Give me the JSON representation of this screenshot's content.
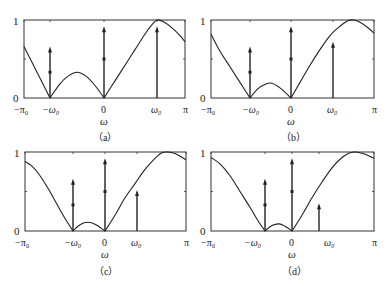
{
  "chart_data": [
    {
      "type": "line",
      "panel": "a",
      "caption": "（a）",
      "xlabel": "ω",
      "ylabel": "",
      "ylim": [
        0,
        1
      ],
      "xlim": [
        "-π",
        "π"
      ],
      "x_tick_labels": [
        "−π₀",
        "−ω₀",
        "0",
        "ω₀",
        "π"
      ],
      "y_tick_labels": [
        "0",
        "1"
      ],
      "frame": {
        "x0": 24,
        "x1": 185,
        "y0": 20,
        "y1": 98
      },
      "tick_px": {
        "-pi": 24,
        "-w0": 50,
        "0": 104,
        "w0": 157,
        "pi": 185
      },
      "curve": [
        [
          24,
          0.66
        ],
        [
          50,
          0.0
        ],
        [
          60,
          0.18
        ],
        [
          68,
          0.28
        ],
        [
          77,
          0.33
        ],
        [
          86,
          0.28
        ],
        [
          95,
          0.16
        ],
        [
          104,
          0.0
        ],
        [
          115,
          0.22
        ],
        [
          125,
          0.42
        ],
        [
          135,
          0.62
        ],
        [
          145,
          0.82
        ],
        [
          152,
          0.94
        ],
        [
          157,
          1.0
        ],
        [
          163,
          0.98
        ],
        [
          172,
          0.9
        ],
        [
          180,
          0.8
        ],
        [
          185,
          0.72
        ]
      ],
      "impulses": [
        {
          "x": "-w0",
          "px": 50,
          "height": 0.66,
          "mark": 0.33
        },
        {
          "x": "0",
          "px": 104,
          "height": 0.92,
          "mark": 0.5
        },
        {
          "x": "w0",
          "px": 157,
          "height": 0.92,
          "mark": null
        }
      ]
    },
    {
      "type": "line",
      "panel": "b",
      "caption": "（b）",
      "xlabel": "ω",
      "ylabel": "",
      "ylim": [
        0,
        1
      ],
      "xlim": [
        "-π",
        "π"
      ],
      "x_tick_labels": [
        "−π₀",
        "−ω₀",
        "0",
        "ω₀",
        "π"
      ],
      "y_tick_labels": [
        "0",
        "1"
      ],
      "frame": {
        "x0": 211,
        "x1": 374,
        "y0": 20,
        "y1": 98
      },
      "tick_px": {
        "-pi": 211,
        "-w0": 250,
        "0": 291,
        "w0": 333,
        "pi": 374
      },
      "curve": [
        [
          211,
          0.82
        ],
        [
          220,
          0.6
        ],
        [
          230,
          0.4
        ],
        [
          240,
          0.2
        ],
        [
          250,
          0.0
        ],
        [
          258,
          0.12
        ],
        [
          266,
          0.18
        ],
        [
          272,
          0.19
        ],
        [
          280,
          0.13
        ],
        [
          291,
          0.0
        ],
        [
          300,
          0.2
        ],
        [
          310,
          0.42
        ],
        [
          320,
          0.62
        ],
        [
          330,
          0.8
        ],
        [
          340,
          0.92
        ],
        [
          348,
          0.99
        ],
        [
          354,
          1.0
        ],
        [
          360,
          0.97
        ],
        [
          368,
          0.9
        ],
        [
          374,
          0.83
        ]
      ],
      "impulses": [
        {
          "x": "-w0",
          "px": 250,
          "height": 0.66,
          "mark": 0.33
        },
        {
          "x": "0",
          "px": 291,
          "height": 0.92,
          "mark": 0.5
        },
        {
          "x": "w0",
          "px": 333,
          "height": 0.72,
          "mark": null
        }
      ]
    },
    {
      "type": "line",
      "panel": "c",
      "caption": "（c）",
      "xlabel": "ω",
      "ylabel": "",
      "ylim": [
        0,
        1
      ],
      "xlim": [
        "-π",
        "π"
      ],
      "x_tick_labels": [
        "−π₀",
        "−ω₀",
        "0",
        "ω₀",
        "π"
      ],
      "y_tick_labels": [
        "0",
        "1"
      ],
      "frame": {
        "x0": 25,
        "x1": 186,
        "y0": 152,
        "y1": 231
      },
      "tick_px": {
        "-pi": 25,
        "-w0": 73,
        "0": 105,
        "w0": 137,
        "pi": 186
      },
      "curve": [
        [
          25,
          0.88
        ],
        [
          32,
          0.82
        ],
        [
          40,
          0.7
        ],
        [
          48,
          0.54
        ],
        [
          56,
          0.36
        ],
        [
          64,
          0.18
        ],
        [
          73,
          0.0
        ],
        [
          80,
          0.08
        ],
        [
          88,
          0.11
        ],
        [
          96,
          0.08
        ],
        [
          105,
          0.0
        ],
        [
          115,
          0.2
        ],
        [
          125,
          0.42
        ],
        [
          135,
          0.6
        ],
        [
          145,
          0.78
        ],
        [
          155,
          0.92
        ],
        [
          162,
          0.99
        ],
        [
          168,
          1.0
        ],
        [
          175,
          0.98
        ],
        [
          181,
          0.94
        ],
        [
          186,
          0.9
        ]
      ],
      "impulses": [
        {
          "x": "-w0",
          "px": 73,
          "height": 0.66,
          "mark": 0.33
        },
        {
          "x": "0",
          "px": 105,
          "height": 0.92,
          "mark": 0.5
        },
        {
          "x": "w0",
          "px": 137,
          "height": 0.52,
          "mark": null
        }
      ]
    },
    {
      "type": "line",
      "panel": "d",
      "caption": "（d）",
      "xlabel": "ω",
      "ylabel": "",
      "ylim": [
        0,
        1
      ],
      "xlim": [
        "-π",
        "π"
      ],
      "x_tick_labels": [
        "−π₀",
        "−ω₀",
        "0",
        "ω₀",
        "π"
      ],
      "y_tick_labels": [
        "0",
        "1"
      ],
      "frame": {
        "x0": 211,
        "x1": 374,
        "y0": 152,
        "y1": 231
      },
      "tick_px": {
        "-pi": 211,
        "-w0": 265,
        "0": 292,
        "w0": 319,
        "pi": 374
      },
      "curve": [
        [
          211,
          0.93
        ],
        [
          220,
          0.85
        ],
        [
          230,
          0.7
        ],
        [
          240,
          0.5
        ],
        [
          250,
          0.3
        ],
        [
          258,
          0.13
        ],
        [
          265,
          0.0
        ],
        [
          272,
          0.07
        ],
        [
          279,
          0.09
        ],
        [
          285,
          0.06
        ],
        [
          292,
          0.0
        ],
        [
          302,
          0.2
        ],
        [
          312,
          0.42
        ],
        [
          322,
          0.62
        ],
        [
          332,
          0.8
        ],
        [
          342,
          0.93
        ],
        [
          350,
          0.99
        ],
        [
          356,
          1.0
        ],
        [
          363,
          0.98
        ],
        [
          369,
          0.95
        ],
        [
          374,
          0.92
        ]
      ],
      "impulses": [
        {
          "x": "-w0",
          "px": 265,
          "height": 0.66,
          "mark": 0.33
        },
        {
          "x": "0",
          "px": 292,
          "height": 0.92,
          "mark": 0.5
        },
        {
          "x": "w0",
          "px": 319,
          "height": 0.35,
          "mark": null
        }
      ]
    }
  ],
  "labels": {
    "a": {
      "y1": "1",
      "y0": "0",
      "xm_pi": "−π₀",
      "xm_w0": "−ω₀",
      "x0": "0",
      "xw0": "ω₀",
      "xpi": "π",
      "xlabel": "ω",
      "caption": "（a）"
    },
    "b": {
      "y1": "1",
      "y0": "0",
      "xm_pi": "−π₀",
      "xm_w0": "−ω₀",
      "x0": "0",
      "xw0": "ω₀",
      "xpi": "π",
      "xlabel": "ω",
      "caption": "（b）"
    },
    "c": {
      "y1": "1",
      "y0": "0",
      "xm_pi": "−π₀",
      "xm_w0": "−ω₀",
      "x0": "0",
      "xw0": "ω₀",
      "xpi": "π",
      "xlabel": "ω",
      "caption": "（c）"
    },
    "d": {
      "y1": "1",
      "y0": "0",
      "xm_pi": "−π₀",
      "xm_w0": "−ω₀",
      "x0": "0",
      "xw0": "ω₀",
      "xpi": "π",
      "xlabel": "ω",
      "caption": "（d）"
    }
  },
  "colors": {
    "line": "#222222",
    "frame": "#333333",
    "background": "#ffffff"
  }
}
